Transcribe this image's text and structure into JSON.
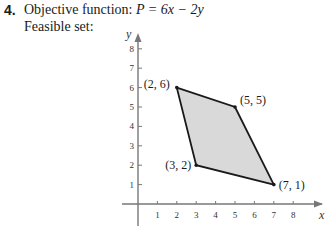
{
  "problem": {
    "number": "4.",
    "objective_label": "Objective function:",
    "objective_expr": "P = 6x − 2y",
    "feasible_label": "Feasible set:"
  },
  "colors": {
    "fill": "#d9d9d9",
    "edge": "#1a1a1a",
    "axis": "#777777"
  },
  "chart_data": {
    "type": "scatter",
    "title": "Feasible set",
    "xlabel": "x",
    "ylabel": "y",
    "xlim": [
      0,
      8
    ],
    "ylim": [
      0,
      8
    ],
    "x_ticks": [
      1,
      2,
      3,
      4,
      5,
      6,
      7,
      8
    ],
    "y_ticks": [
      1,
      2,
      3,
      4,
      5,
      6,
      7,
      8
    ],
    "polygon": [
      [
        2,
        6
      ],
      [
        5,
        5
      ],
      [
        7,
        1
      ],
      [
        3,
        2
      ]
    ],
    "vertices": [
      {
        "label": "(2, 6)",
        "x": 2,
        "y": 6
      },
      {
        "label": "(5, 5)",
        "x": 5,
        "y": 5
      },
      {
        "label": "(7, 1)",
        "x": 7,
        "y": 1
      },
      {
        "label": "(3, 2)",
        "x": 3,
        "y": 2
      }
    ],
    "grid": false
  }
}
